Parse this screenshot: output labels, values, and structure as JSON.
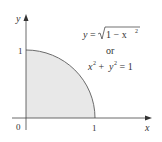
{
  "diagram": {
    "axes": {
      "x_label": "x",
      "y_label": "y",
      "origin_label": "0",
      "x_tick_label": "1",
      "y_tick_label": "1"
    },
    "equation": {
      "line1_lhs": "y",
      "line1_eq": "=",
      "line1_rad": "1 − x",
      "line1_exp": "2",
      "line2": "or",
      "line3_x": "x",
      "line3_exp1": "2",
      "line3_plus": " + ",
      "line3_y": "y",
      "line3_exp2": "2",
      "line3_rest": " = 1"
    },
    "colors": {
      "fill": "#e8e8e8",
      "curve": "#6b6b6b",
      "axis": "#444444"
    }
  }
}
